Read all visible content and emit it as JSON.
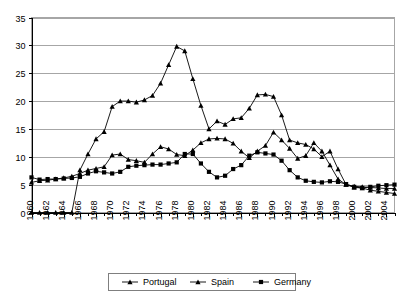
{
  "chart_data": {
    "type": "line",
    "title": "",
    "xlabel": "",
    "ylabel": "",
    "xlim": [
      1960,
      2005
    ],
    "ylim": [
      0,
      35
    ],
    "ytick_step": 5,
    "xtick_step": 1,
    "xtick_label_step": 2,
    "grid": true,
    "legend_position": "bottom",
    "yticks": [
      "0",
      "5",
      "10",
      "15",
      "20",
      "25",
      "30",
      "35"
    ],
    "xticks": [
      "1960",
      "1962",
      "1964",
      "1966",
      "1968",
      "1970",
      "1972",
      "1974",
      "1976",
      "1978",
      "1980",
      "1982",
      "1984",
      "1986",
      "1988",
      "1990",
      "1992",
      "1994",
      "1996",
      "1998",
      "2000",
      "2002",
      "2004"
    ],
    "x": [
      1960,
      1961,
      1962,
      1963,
      1964,
      1965,
      1966,
      1967,
      1968,
      1969,
      1970,
      1971,
      1972,
      1973,
      1974,
      1975,
      1976,
      1977,
      1978,
      1979,
      1980,
      1981,
      1982,
      1983,
      1984,
      1985,
      1986,
      1987,
      1988,
      1989,
      1990,
      1991,
      1992,
      1993,
      1994,
      1995,
      1996,
      1997,
      1998,
      1999,
      2000,
      2001,
      2002,
      2003,
      2004,
      2005
    ],
    "series": [
      {
        "name": "Portugal",
        "marker": "triangle",
        "values": [
          0,
          0,
          0,
          0,
          0,
          0,
          7.6,
          10.5,
          13.2,
          14.5,
          19.0,
          20.0,
          20.0,
          19.8,
          20.2,
          21.0,
          23.2,
          26.5,
          29.8,
          29.0,
          24.0,
          19.2,
          15.0,
          16.4,
          15.8,
          16.8,
          17.0,
          18.7,
          21.1,
          21.2,
          20.8,
          17.5,
          13.0,
          12.5,
          12.2,
          11.4,
          10.0,
          11.0,
          7.8,
          5.0,
          4.5,
          4.4,
          4.0,
          3.8,
          3.6,
          3.4
        ]
      },
      {
        "name": "Spain",
        "marker": "triangle",
        "values": [
          5.4,
          5.7,
          5.8,
          6.0,
          6.2,
          6.5,
          7.0,
          7.6,
          7.9,
          8.2,
          10.3,
          10.5,
          9.5,
          9.3,
          9.0,
          10.5,
          11.8,
          11.4,
          10.4,
          10.2,
          11.2,
          12.5,
          13.2,
          13.3,
          13.2,
          12.4,
          11.0,
          9.8,
          11.0,
          12.0,
          14.4,
          13.0,
          11.5,
          9.7,
          10.2,
          12.5,
          11.0,
          8.5,
          6.0,
          5.0,
          4.7,
          4.6,
          4.5,
          4.4,
          4.3,
          4.3
        ]
      },
      {
        "name": "Germany",
        "marker": "square",
        "values": [
          6.3,
          5.9,
          6.0,
          6.0,
          6.1,
          6.2,
          6.4,
          7.0,
          7.4,
          7.2,
          7.0,
          7.3,
          8.2,
          8.4,
          8.5,
          8.6,
          8.6,
          8.8,
          9.0,
          10.5,
          10.5,
          8.8,
          7.3,
          6.3,
          6.6,
          7.8,
          8.5,
          10.2,
          10.8,
          10.6,
          10.4,
          9.3,
          7.6,
          6.3,
          5.7,
          5.5,
          5.4,
          5.6,
          5.5,
          5.1,
          4.6,
          4.4,
          4.6,
          4.8,
          4.9,
          5.0
        ]
      }
    ]
  },
  "legend": {
    "items": [
      {
        "label": "Portugal",
        "marker": "triangle"
      },
      {
        "label": "Spain",
        "marker": "triangle"
      },
      {
        "label": "Germany",
        "marker": "square"
      }
    ]
  }
}
